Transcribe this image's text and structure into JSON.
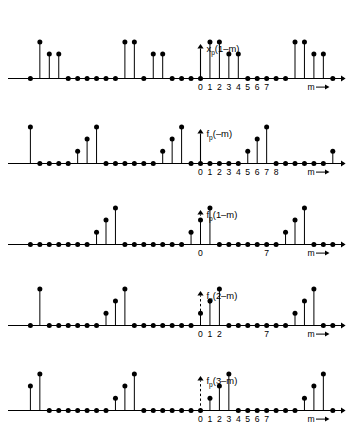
{
  "figure": {
    "type": "stem-plot-series",
    "background": "#ffffff",
    "ink": "#000000",
    "axis_variable": "m",
    "arrow_label": "m",
    "panel_count": 5
  },
  "chart_data": [
    {
      "type": "scatter",
      "name": "panel-1",
      "title": "x_p(1-m)",
      "label_main": "x",
      "label_sub": "p",
      "label_arg": "(1–m)",
      "xlabel": "m",
      "ylabel": "",
      "grid": false,
      "origin_marker": "solid-arrow",
      "tick_labels": [
        "0",
        "1",
        "2",
        "3",
        "4",
        "5",
        "6",
        "7"
      ],
      "tick_values": [
        0,
        1,
        2,
        3,
        4,
        5,
        6,
        7
      ],
      "period": 9,
      "ylim": [
        0,
        4
      ],
      "x": [
        -18,
        -17,
        -16,
        -15,
        -14,
        -13,
        -12,
        -11,
        -10,
        -9,
        -8,
        -7,
        -6,
        -5,
        -4,
        -3,
        -2,
        -1,
        0,
        1,
        2,
        3,
        4,
        5,
        6,
        7,
        8,
        9,
        10,
        11,
        12,
        13,
        14
      ],
      "values": [
        0,
        3,
        2,
        2,
        0,
        0,
        0,
        0,
        0,
        0,
        3,
        3,
        0,
        2,
        2,
        0,
        0,
        0,
        0,
        3,
        3,
        2,
        2,
        0,
        0,
        0,
        0,
        0,
        3,
        3,
        2,
        2,
        0
      ],
      "annotations": []
    },
    {
      "type": "scatter",
      "name": "panel-2",
      "title": "f_p(-m)",
      "label_main": "f",
      "label_sub": "p",
      "label_arg": "(–m)",
      "xlabel": "m",
      "ylabel": "",
      "grid": false,
      "origin_marker": "solid-arrow",
      "tick_labels": [
        "0",
        "1",
        "2",
        "3",
        "4",
        "5",
        "6",
        "7",
        "8"
      ],
      "tick_values": [
        0,
        1,
        2,
        3,
        4,
        5,
        6,
        7,
        8
      ],
      "period": 9,
      "ylim": [
        0,
        4
      ],
      "x": [
        -18,
        -17,
        -16,
        -15,
        -14,
        -13,
        -12,
        -11,
        -10,
        -9,
        -8,
        -7,
        -6,
        -5,
        -4,
        -3,
        -2,
        -1,
        0,
        1,
        2,
        3,
        4,
        5,
        6,
        7,
        8,
        9,
        10,
        11,
        12,
        13,
        14
      ],
      "values": [
        3,
        0,
        0,
        0,
        0,
        1,
        2,
        3,
        0,
        0,
        0,
        0,
        0,
        0,
        1,
        2,
        3,
        0,
        0,
        0,
        0,
        0,
        0,
        1,
        2,
        3,
        0,
        0,
        0,
        0,
        0,
        0,
        1
      ],
      "annotations": []
    },
    {
      "type": "scatter",
      "name": "panel-3",
      "title": "f_p(1-m)",
      "label_main": "f",
      "label_sub": "p",
      "label_arg": "(1–m)",
      "xlabel": "m",
      "ylabel": "",
      "grid": false,
      "origin_marker": "dashed-arrow",
      "tick_labels": [
        "0",
        "7"
      ],
      "tick_values": [
        0,
        7
      ],
      "period": 9,
      "ylim": [
        0,
        4
      ],
      "x": [
        -18,
        -17,
        -16,
        -15,
        -14,
        -13,
        -12,
        -11,
        -10,
        -9,
        -8,
        -7,
        -6,
        -5,
        -4,
        -3,
        -2,
        -1,
        0,
        1,
        2,
        3,
        4,
        5,
        6,
        7,
        8,
        9,
        10,
        11,
        12,
        13,
        14
      ],
      "values": [
        0,
        0,
        0,
        0,
        0,
        0,
        0,
        1,
        2,
        3,
        0,
        0,
        0,
        0,
        0,
        0,
        0,
        1,
        2,
        3,
        0,
        0,
        0,
        0,
        0,
        0,
        0,
        1,
        2,
        3,
        0,
        0,
        0
      ],
      "annotations": []
    },
    {
      "type": "scatter",
      "name": "panel-4",
      "title": "f_p(2-m)",
      "label_main": "f",
      "label_sub": "p",
      "label_arg": "(2–m)",
      "xlabel": "m",
      "ylabel": "",
      "grid": false,
      "origin_marker": "dashed-arrow",
      "tick_labels": [
        "0",
        "1",
        "2",
        "7"
      ],
      "tick_values": [
        0,
        1,
        2,
        7
      ],
      "period": 9,
      "ylim": [
        0,
        4
      ],
      "x": [
        -18,
        -17,
        -16,
        -15,
        -14,
        -13,
        -12,
        -11,
        -10,
        -9,
        -8,
        -7,
        -6,
        -5,
        -4,
        -3,
        -2,
        -1,
        0,
        1,
        2,
        3,
        4,
        5,
        6,
        7,
        8,
        9,
        10,
        11,
        12,
        13,
        14
      ],
      "values": [
        0,
        3,
        0,
        0,
        0,
        0,
        0,
        0,
        1,
        2,
        3,
        0,
        0,
        0,
        0,
        0,
        0,
        0,
        1,
        2,
        3,
        0,
        0,
        0,
        0,
        0,
        0,
        0,
        1,
        2,
        3,
        0,
        0
      ],
      "annotations": []
    },
    {
      "type": "scatter",
      "name": "panel-5",
      "title": "f_p(3-m)",
      "label_main": "f",
      "label_sub": "p",
      "label_arg": "(3–m)",
      "xlabel": "m",
      "ylabel": "",
      "grid": false,
      "origin_marker": "dashed-arrow",
      "tick_labels": [
        "0",
        "1",
        "2",
        "3",
        "4",
        "5",
        "6",
        "7"
      ],
      "tick_values": [
        0,
        1,
        2,
        3,
        4,
        5,
        6,
        7
      ],
      "period": 9,
      "ylim": [
        0,
        4
      ],
      "x": [
        -18,
        -17,
        -16,
        -15,
        -14,
        -13,
        -12,
        -11,
        -10,
        -9,
        -8,
        -7,
        -6,
        -5,
        -4,
        -3,
        -2,
        -1,
        0,
        1,
        2,
        3,
        4,
        5,
        6,
        7,
        8,
        9,
        10,
        11,
        12,
        13,
        14
      ],
      "values": [
        2,
        3,
        0,
        0,
        0,
        0,
        0,
        0,
        0,
        1,
        2,
        3,
        0,
        0,
        0,
        0,
        0,
        0,
        0,
        1,
        2,
        3,
        0,
        0,
        0,
        0,
        0,
        0,
        0,
        1,
        2,
        3,
        0
      ],
      "annotations": []
    }
  ]
}
